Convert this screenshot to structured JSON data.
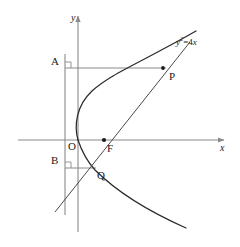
{
  "figure": {
    "kind": "geometry-diagram",
    "caption_equation": {
      "base": "y",
      "exponent": "2",
      "relation": "=4",
      "variable": "x",
      "plain": "y²=4x"
    },
    "axes": {
      "x_label": "x",
      "y_label": "y"
    },
    "points": [
      {
        "id": "A",
        "label": "A",
        "x": 55,
        "y": 62,
        "marked_dot": false
      },
      {
        "id": "P",
        "label": "P",
        "x": 172,
        "y": 74,
        "marked_dot": true
      },
      {
        "id": "O",
        "label": "O",
        "x": 72,
        "y": 145,
        "marked_dot": false
      },
      {
        "id": "F",
        "label": "F",
        "x": 110,
        "y": 148,
        "marked_dot": true
      },
      {
        "id": "B",
        "label": "B",
        "x": 55,
        "y": 160,
        "marked_dot": false
      },
      {
        "id": "Q",
        "label": "Q",
        "x": 100,
        "y": 176,
        "marked_dot": false
      }
    ],
    "right_angle_markers": [
      {
        "at": "A",
        "x": 65,
        "y": 66
      },
      {
        "at": "B",
        "x": 65,
        "y": 160
      }
    ],
    "colors": {
      "axis": "#8a8a8a",
      "directrix": "#8a8a8a",
      "curve": "#2b2b2b",
      "chord": "#4a4a4a",
      "connector": "#8a8a8a",
      "text": "#1a1a1a",
      "background": "#ffffff"
    },
    "geometry": {
      "y_axis_x": 78,
      "x_axis_y": 140,
      "directrix_x": 65,
      "focus": {
        "x": 104,
        "y": 140
      },
      "vertex": {
        "x": 78,
        "y": 140
      },
      "P_point": {
        "x": 163,
        "y": 68
      },
      "Q_point": {
        "x": 93,
        "y": 168
      },
      "A_foot": {
        "x": 65,
        "y": 68
      },
      "B_foot": {
        "x": 65,
        "y": 168
      }
    }
  }
}
